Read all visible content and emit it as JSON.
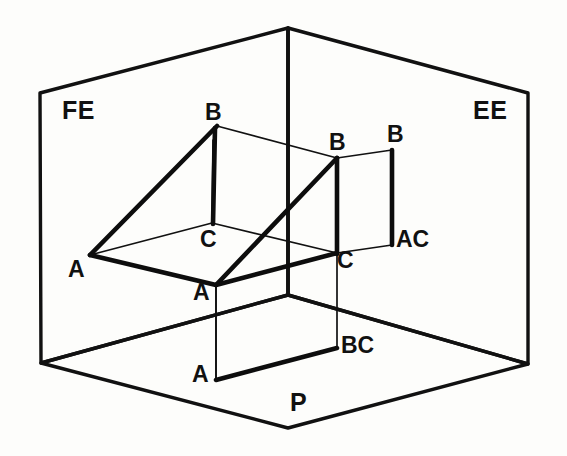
{
  "figure": {
    "background_color": "#fdfdfb",
    "line_color": "#111111"
  },
  "planes": [
    {
      "id": "front-elevation",
      "label": "FE",
      "label_x": 62,
      "label_y": 98,
      "description": "Vertical plane on the left - Front Elevation"
    },
    {
      "id": "end-elevation",
      "label": "EE",
      "label_x": 473,
      "label_y": 98,
      "description": "Vertical plane on the right - End Elevation"
    },
    {
      "id": "plan",
      "label": "P",
      "label_x": 290,
      "label_y": 390,
      "description": "Horizontal plane at the bottom - Plan"
    }
  ],
  "vertex_labels": [
    {
      "id": "fe-b",
      "text": "B",
      "x": 205,
      "y": 101
    },
    {
      "id": "fe-c",
      "text": "C",
      "x": 200,
      "y": 228
    },
    {
      "id": "fe-a",
      "text": "A",
      "x": 68,
      "y": 258
    },
    {
      "id": "solid-a",
      "text": "A",
      "x": 193,
      "y": 281
    },
    {
      "id": "ee-b-inner",
      "text": "B",
      "x": 329,
      "y": 131
    },
    {
      "id": "ee-b-outer",
      "text": "B",
      "x": 387,
      "y": 123
    },
    {
      "id": "ee-c",
      "text": "C",
      "x": 337,
      "y": 249
    },
    {
      "id": "ee-ac",
      "text": "AC",
      "x": 396,
      "y": 228
    },
    {
      "id": "p-a",
      "text": "A",
      "x": 192,
      "y": 363
    },
    {
      "id": "p-bc",
      "text": "BC",
      "x": 341,
      "y": 334
    }
  ],
  "geometry": {
    "scene_corners": {
      "apex_top": [
        288,
        28
      ],
      "left_panel_top": [
        40,
        93
      ],
      "right_panel_top": [
        528,
        93
      ],
      "left_panel_bottom": [
        41,
        363
      ],
      "right_panel_bottom": [
        528,
        364
      ],
      "floor_front": [
        288,
        428
      ],
      "center_junction": [
        288,
        295
      ]
    },
    "solid_vertices": {
      "A_front": [
        216,
        285
      ],
      "B_top": [
        337,
        158
      ],
      "C_right": [
        337,
        253
      ],
      "A_left_fe": [
        90,
        255
      ],
      "B_left_fe": [
        217,
        126
      ],
      "C_mid_fe": [
        212,
        223
      ]
    },
    "projection_rects": {
      "end_elevation": [
        [
          337,
          158
        ],
        [
          392,
          150
        ],
        [
          392,
          245
        ],
        [
          337,
          253
        ]
      ],
      "plan": [
        [
          216,
          285
        ],
        [
          337,
          253
        ],
        [
          337,
          348
        ],
        [
          216,
          380
        ]
      ]
    }
  }
}
